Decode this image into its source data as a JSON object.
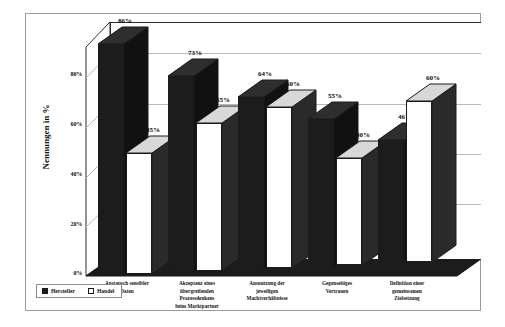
{
  "chart_data": {
    "type": "bar",
    "title": "",
    "subtitle": "",
    "xlabel": "",
    "ylabel": "Nennungen in %",
    "ylim": [
      0,
      90
    ],
    "ytick_labels": [
      "0%",
      "20%",
      "40%",
      "60%",
      "80%"
    ],
    "ytick_values": [
      0,
      20,
      40,
      60,
      80
    ],
    "grid": true,
    "legend_position": "bottom-left",
    "categories": [
      "Austausch sensibler Daten",
      "Akzeptanz eines übergreifenden Prozessdenkens beim Marktpartner",
      "Ausnutzung der jeweiligen Machtverhältnisse",
      "Gegenseitiges Vertrauen",
      "Definition einer gemeinsamen Zielsetzung"
    ],
    "category_lines": [
      [
        "Austausch sensibler",
        "Daten"
      ],
      [
        "Akzeptanz eines",
        "übergreifenden",
        "Prozessdenkens",
        "beim Marktpartner"
      ],
      [
        "Ausnutzung der",
        "jeweiligen",
        "Machtverhältnisse"
      ],
      [
        "Gegenseitiges",
        "Vertrauen"
      ],
      [
        "Definition einer",
        "gemeinsamen",
        "Zielsetzung"
      ]
    ],
    "series": [
      {
        "name": "Hersteller",
        "color": "#1c1c1c",
        "values": [
          86,
          73,
          64,
          55,
          46
        ],
        "labels": [
          "86%",
          "73%",
          "64%",
          "55%",
          "46%"
        ]
      },
      {
        "name": "Handel",
        "color": "#ffffff",
        "values": [
          45,
          55,
          60,
          40,
          60
        ],
        "labels": [
          "45%",
          "55%",
          "60%",
          "40%",
          "60%"
        ]
      }
    ]
  },
  "legend": {
    "items": [
      {
        "label": "Hersteller",
        "swatch": "dark"
      },
      {
        "label": "Handel",
        "swatch": "light"
      }
    ]
  }
}
